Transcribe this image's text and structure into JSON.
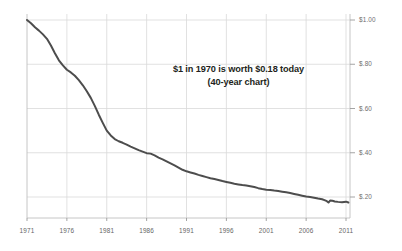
{
  "chart_data": {
    "type": "line",
    "title": "",
    "subtitle": "",
    "annotation": {
      "line1": "$1 in 1970 is worth $0.18 today",
      "line2": "(40-year chart)"
    },
    "xlabel": "",
    "ylabel": "",
    "xlim": [
      1971,
      2011.5
    ],
    "ylim": [
      0.0,
      1.0
    ],
    "grid": true,
    "legend": false,
    "legend_position": "none",
    "series_color": "#4d4d4d",
    "grid_color": "#d9d9d9",
    "axis_color": "#bfbfbf",
    "background_color": "#ffffff",
    "y_ticks": [
      {
        "value": 1.0,
        "label": "$1.00"
      },
      {
        "value": 0.8,
        "label": "$.80"
      },
      {
        "value": 0.6,
        "label": "$.60"
      },
      {
        "value": 0.4,
        "label": "$.40"
      },
      {
        "value": 0.2,
        "label": "$.20"
      }
    ],
    "x_ticks": [
      {
        "value": 1971,
        "label": "1971"
      },
      {
        "value": 1976,
        "label": "1976"
      },
      {
        "value": 1981,
        "label": "1981"
      },
      {
        "value": 1986,
        "label": "1986"
      },
      {
        "value": 1991,
        "label": "1991"
      },
      {
        "value": 1996,
        "label": "1996"
      },
      {
        "value": 2001,
        "label": "2001"
      },
      {
        "value": 2006,
        "label": "2006"
      },
      {
        "value": 2011,
        "label": "2011"
      }
    ],
    "series": [
      {
        "name": "Purchasing power of $1 (1970 dollars)",
        "x": [
          1971,
          1971.5,
          1972,
          1972.5,
          1973,
          1973.5,
          1974,
          1974.5,
          1975,
          1975.5,
          1976,
          1976.5,
          1977,
          1977.5,
          1978,
          1978.5,
          1979,
          1979.5,
          1980,
          1980.5,
          1981,
          1981.5,
          1982,
          1982.5,
          1983,
          1983.5,
          1984,
          1984.5,
          1985,
          1985.5,
          1986,
          1986.5,
          1987,
          1987.5,
          1988,
          1988.5,
          1989,
          1989.5,
          1990,
          1990.5,
          1991,
          1991.5,
          1992,
          1992.5,
          1993,
          1993.5,
          1994,
          1994.5,
          1995,
          1995.5,
          1996,
          1996.5,
          1997,
          1997.5,
          1998,
          1998.5,
          1999,
          1999.5,
          2000,
          2000.5,
          2001,
          2001.5,
          2002,
          2002.5,
          2003,
          2003.5,
          2004,
          2004.5,
          2005,
          2005.5,
          2006,
          2006.5,
          2007,
          2007.5,
          2008,
          2008.3,
          2008.6,
          2008.8,
          2009,
          2009.3,
          2009.6,
          2010,
          2010.5,
          2011,
          2011.3
        ],
        "y": [
          1.0,
          0.985,
          0.967,
          0.952,
          0.935,
          0.915,
          0.885,
          0.85,
          0.818,
          0.795,
          0.775,
          0.763,
          0.748,
          0.728,
          0.705,
          0.678,
          0.648,
          0.612,
          0.572,
          0.535,
          0.5,
          0.478,
          0.462,
          0.452,
          0.445,
          0.437,
          0.428,
          0.42,
          0.412,
          0.405,
          0.398,
          0.396,
          0.388,
          0.378,
          0.37,
          0.361,
          0.352,
          0.343,
          0.333,
          0.323,
          0.316,
          0.311,
          0.306,
          0.3,
          0.295,
          0.29,
          0.285,
          0.281,
          0.277,
          0.272,
          0.268,
          0.264,
          0.26,
          0.257,
          0.254,
          0.252,
          0.249,
          0.245,
          0.24,
          0.236,
          0.233,
          0.232,
          0.229,
          0.227,
          0.224,
          0.221,
          0.218,
          0.214,
          0.21,
          0.206,
          0.202,
          0.2,
          0.197,
          0.193,
          0.19,
          0.186,
          0.181,
          0.175,
          0.184,
          0.183,
          0.18,
          0.178,
          0.176,
          0.179,
          0.175
        ]
      }
    ]
  }
}
